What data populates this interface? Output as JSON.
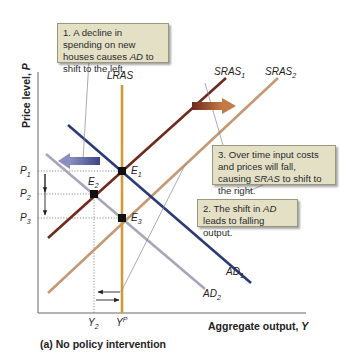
{
  "figure": {
    "caption": "(a) No policy intervention",
    "y_axis_title": "Price level, P",
    "y_axis_title_main": "Price level, ",
    "y_axis_title_var": "P",
    "x_axis_title_main": "Aggregate output, ",
    "x_axis_title_var": "Y"
  },
  "curves": {
    "lras": "LRAS",
    "sras1": {
      "base": "SRAS",
      "sub": "1"
    },
    "sras2": {
      "base": "SRAS",
      "sub": "2"
    },
    "ad1": {
      "base": "AD",
      "sub": "1"
    },
    "ad2": {
      "base": "AD",
      "sub": "2"
    }
  },
  "points": {
    "e1": {
      "base": "E",
      "sub": "1"
    },
    "e2": {
      "base": "E",
      "sub": "2"
    },
    "e3": {
      "base": "E",
      "sub": "3"
    }
  },
  "ticks": {
    "p1": {
      "base": "P",
      "sub": "1"
    },
    "p2": {
      "base": "P",
      "sub": "2"
    },
    "p3": {
      "base": "P",
      "sub": "3"
    },
    "y2": {
      "base": "Y",
      "sub": "2"
    },
    "yp": {
      "base": "Y",
      "sup": "P"
    }
  },
  "notes": {
    "note1": {
      "pre": "1. A decline in spending on new houses causes ",
      "em": "AD",
      "post": " to shift to the left."
    },
    "note2": {
      "pre": "2. The shift in ",
      "em": "AD",
      "post": " leads to falling output."
    },
    "note3": {
      "pre": "3. Over time input costs and prices will fall, causing ",
      "em": "SRAS",
      "post": " to shift to the right."
    }
  },
  "colors": {
    "lras": "#d49a3a",
    "sras1": "#6e2a1c",
    "sras2": "#c49a76",
    "ad1": "#2a3a78",
    "ad2": "#a6a6b8",
    "shift_ad_arrow": "#5a5f9e",
    "shift_sras_arrow": "#8e4a2a",
    "note_bg": "#e4e0c6"
  }
}
